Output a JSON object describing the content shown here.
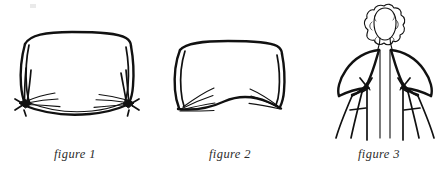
{
  "document": {
    "title": "Scarf tying instructions",
    "type": "line-art instructional diagram",
    "background_color": "#ffffff",
    "ink_color": "#111111",
    "caption_color": "#2b2b2b"
  },
  "panels": [
    {
      "id": "panel-1",
      "caption": "figure 1",
      "figure_name": "rectangular-cloth-with-two-tied-corner-knots",
      "description": "A rectangular folded cloth drawn in outline with both lower corners gathered and tied into small knots, with radiating gather lines fanning inward from each knot."
    },
    {
      "id": "panel-2",
      "caption": "figure 2",
      "figure_name": "rectangular-cloth-with-gathered-lower-corners",
      "description": "A rectangular folded cloth drawn in outline with the lower corners gathered into fan-shaped pleats, bottom edge curving upward in the middle."
    },
    {
      "id": "panel-3",
      "caption": "figure 3",
      "figure_name": "person-wearing-wrap-with-knots-at-shoulders",
      "description": "Front view of a person with curly hair wearing the cloth as a wrap over both shoulders; the ends are knotted at each side and the loose tails hang down past the hips."
    }
  ],
  "captions": {
    "figure_1": "figure 1",
    "figure_2": "figure 2",
    "figure_3": "figure 3"
  }
}
